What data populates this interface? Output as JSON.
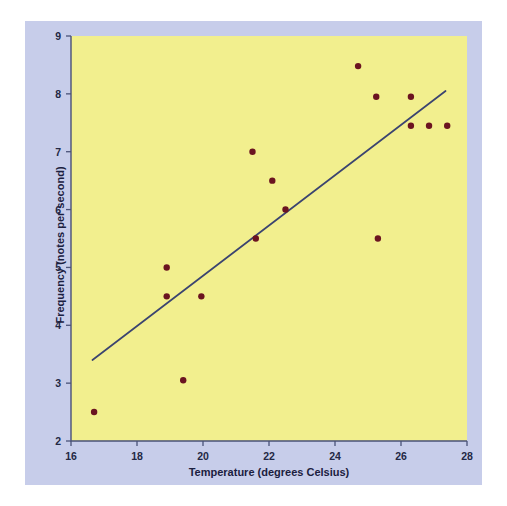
{
  "chart_data": {
    "type": "scatter",
    "title": "",
    "xlabel": "Temperature (degrees Celsius)",
    "ylabel": "Frequency (notes per second)",
    "xlim": [
      16,
      28
    ],
    "ylim": [
      2,
      9
    ],
    "xticks": [
      16,
      18,
      20,
      22,
      24,
      26,
      28
    ],
    "yticks": [
      2,
      3,
      4,
      5,
      6,
      7,
      8,
      9
    ],
    "xtick_labels": [
      "16",
      "18",
      "20",
      "22",
      "24",
      "26",
      "28"
    ],
    "ytick_labels": [
      "2",
      "3",
      "4",
      "5",
      "6",
      "7",
      "8",
      "9"
    ],
    "grid": false,
    "legend": "none",
    "series": [
      {
        "name": "Cricket chirp observations",
        "marker": "circle",
        "color": "#6b1420",
        "points": [
          {
            "x": 16.7,
            "y": 2.5
          },
          {
            "x": 18.9,
            "y": 5.0
          },
          {
            "x": 18.9,
            "y": 4.5
          },
          {
            "x": 19.4,
            "y": 3.05
          },
          {
            "x": 19.95,
            "y": 4.5
          },
          {
            "x": 21.5,
            "y": 7.0
          },
          {
            "x": 21.6,
            "y": 5.5
          },
          {
            "x": 22.1,
            "y": 6.5
          },
          {
            "x": 22.5,
            "y": 6.0
          },
          {
            "x": 24.7,
            "y": 8.48
          },
          {
            "x": 25.25,
            "y": 7.95
          },
          {
            "x": 25.3,
            "y": 5.5
          },
          {
            "x": 26.3,
            "y": 7.95
          },
          {
            "x": 26.3,
            "y": 7.45
          },
          {
            "x": 26.85,
            "y": 7.45
          },
          {
            "x": 27.4,
            "y": 7.45
          }
        ]
      }
    ],
    "trend_line": {
      "name": "least-squares regression line",
      "color": "#3b4470",
      "x_start": 16.65,
      "y_start": 3.4,
      "x_end": 27.35,
      "y_end": 8.05
    },
    "colors": {
      "plot_background": "#f2ef8e",
      "card_background": "#c7cdea",
      "axis": "#4a5278",
      "marker": "#6b1420",
      "trend_line": "#3b4470",
      "text": "#1b2040"
    }
  }
}
